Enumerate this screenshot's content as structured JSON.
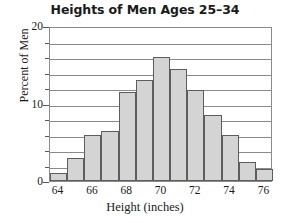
{
  "chart_data": {
    "type": "bar",
    "title": "Heights of Men Ages 25–34",
    "xlabel": "Height (inches)",
    "ylabel": "Percent of Men",
    "grid": true,
    "legend": null,
    "xlim": [
      63.5,
      76.5
    ],
    "ylim": [
      0,
      20
    ],
    "y_major_ticks": [
      0,
      10,
      20
    ],
    "y_major_tick_labels": [
      "0",
      "10",
      "20"
    ],
    "y_minor_ticks": [
      2,
      4,
      6,
      8,
      12,
      14,
      16,
      18
    ],
    "gridline_values": [
      2,
      4,
      6,
      8,
      10,
      12,
      14,
      16,
      18
    ],
    "x_tick_labels": [
      "64",
      "66",
      "68",
      "70",
      "72",
      "74",
      "76"
    ],
    "x_tick_values": [
      64,
      66,
      68,
      70,
      72,
      74,
      76
    ],
    "bin_width": 1,
    "categories": [
      "64",
      "65",
      "66",
      "67",
      "68",
      "69",
      "70",
      "71",
      "72",
      "73",
      "74",
      "75",
      "76"
    ],
    "values": [
      1.0,
      3.0,
      6.0,
      6.5,
      11.5,
      13.0,
      16.0,
      14.5,
      11.8,
      8.5,
      6.0,
      2.5,
      1.5
    ],
    "colors": {
      "bar_fill": "#d4d4d4",
      "bar_stroke": "#5d5d5d",
      "grid": "#8a8a8a",
      "frame": "#8a8a8a",
      "text": "#1a1a1a",
      "background": "#ffffff"
    }
  }
}
